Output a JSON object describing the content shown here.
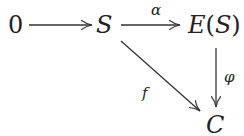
{
  "diagram": {
    "type": "commutative-diagram",
    "nodes": {
      "zero": "0",
      "s": "S",
      "es": "E(S)",
      "c": "C"
    },
    "arrows": {
      "zero_to_s": {
        "from": "0",
        "to": "S",
        "label": ""
      },
      "alpha": {
        "from": "S",
        "to": "E(S)",
        "label": "α"
      },
      "phi": {
        "from": "E(S)",
        "to": "C",
        "label": "φ"
      },
      "f": {
        "from": "S",
        "to": "C",
        "label": "f"
      }
    },
    "colors": {
      "ink": "#222222",
      "background": "#ffffff"
    }
  }
}
